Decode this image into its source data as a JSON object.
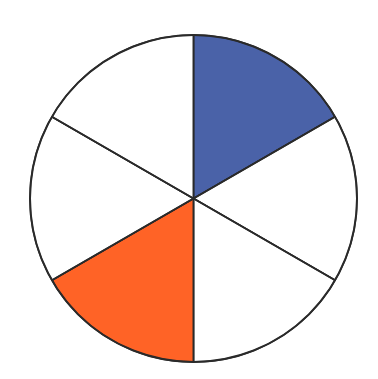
{
  "diagram": {
    "type": "fraction-circle",
    "total_parts": 6,
    "center": [
      193.5,
      198.5
    ],
    "radius": 163.5,
    "start_angle_deg": 0,
    "direction": "clockwise-from-top",
    "stroke_color": "#2a2a2a",
    "stroke_width": 2,
    "background_fill": "#ffffff",
    "sectors": [
      {
        "index": 0,
        "from_deg": 0,
        "to_deg": 60,
        "fill": "#4a62a8",
        "label": "blue part"
      },
      {
        "index": 1,
        "from_deg": 60,
        "to_deg": 120,
        "fill": "#ffffff",
        "label": "white part"
      },
      {
        "index": 2,
        "from_deg": 120,
        "to_deg": 180,
        "fill": "#ffffff",
        "label": "white part"
      },
      {
        "index": 3,
        "from_deg": 180,
        "to_deg": 240,
        "fill": "#ff6326",
        "label": "orange part"
      },
      {
        "index": 4,
        "from_deg": 240,
        "to_deg": 300,
        "fill": "#ffffff",
        "label": "white part"
      },
      {
        "index": 5,
        "from_deg": 300,
        "to_deg": 360,
        "fill": "#ffffff",
        "label": "white part"
      }
    ],
    "shaded_counts": {
      "blue": 1,
      "orange": 1,
      "white": 4
    }
  }
}
